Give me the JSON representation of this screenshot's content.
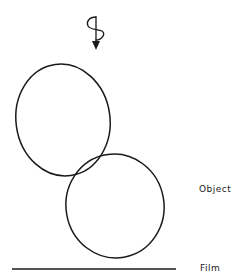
{
  "diagram": {
    "labels": {
      "object": "Object",
      "film": "Film"
    },
    "elements": {
      "helical_arrow": {
        "description": "downward arrow with helical/spiral winding indicating incident beam direction",
        "x": 96,
        "y_start": 18,
        "y_end": 50
      },
      "upper_sphere": {
        "cx": 63,
        "cy": 120,
        "rx": 47,
        "ry": 56
      },
      "lower_sphere": {
        "cx": 115,
        "cy": 206,
        "rx": 49,
        "ry": 52
      },
      "film_line": {
        "x1": 12,
        "x2": 176,
        "y": 269
      }
    },
    "stroke_color": "#1a1a1a",
    "background": "#ffffff"
  }
}
